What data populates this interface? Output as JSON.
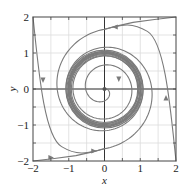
{
  "chart_data": {
    "type": "line",
    "title": "",
    "subtitle": "Phase portrait with stable limit cycle (spiral out from origin, spiral in from outside)",
    "xlabel": "x",
    "ylabel": "y",
    "xlim": [
      -2,
      2
    ],
    "ylim": [
      -2,
      2
    ],
    "xticks": [
      -2,
      -1,
      0,
      1,
      2
    ],
    "yticks": [
      -2,
      -1,
      0,
      1,
      2
    ],
    "xtick_labels": [
      "−2",
      "−1",
      "0",
      "1",
      "2"
    ],
    "ytick_labels": [
      "−2",
      "−1",
      "0",
      "1",
      "2"
    ],
    "grid": true,
    "grid_spacing": 0.5,
    "legend": null,
    "series": [
      {
        "name": "limit-cycle",
        "description": "Closed orbit approximately a circle of radius 1 centered at origin",
        "radius": 1.0
      },
      {
        "name": "inner-spiral",
        "description": "Trajectory starting near origin spiraling outward toward the limit cycle",
        "start": [
          0.05,
          0.0
        ],
        "approach_radius": 1.0
      },
      {
        "name": "outer-trajectory-top",
        "description": "Trajectory entering from (2,2), passing near (0,1.65), spiraling inward to the limit cycle",
        "start": [
          2,
          2
        ],
        "points": [
          [
            2,
            2
          ],
          [
            1,
            1.9
          ],
          [
            0.3,
            1.75
          ],
          [
            0,
            1.65
          ],
          [
            -0.6,
            1.4
          ],
          [
            -1.1,
            0.8
          ],
          [
            -1.25,
            0
          ],
          [
            -1.1,
            -0.7
          ],
          [
            -0.5,
            -1.15
          ],
          [
            0.3,
            -1.15
          ],
          [
            1,
            -0.6
          ],
          [
            1.15,
            0.1
          ]
        ]
      },
      {
        "name": "outer-trajectory-bottom",
        "description": "Trajectory entering from (-2,-2), passing near (0,-1.65), spiraling inward to the limit cycle",
        "start": [
          -2,
          -2
        ],
        "points": [
          [
            -2,
            -2
          ],
          [
            -1,
            -1.9
          ],
          [
            -0.3,
            -1.75
          ],
          [
            0,
            -1.65
          ],
          [
            0.6,
            -1.4
          ],
          [
            1.1,
            -0.8
          ],
          [
            1.25,
            0
          ],
          [
            1.1,
            0.7
          ],
          [
            0.5,
            1.15
          ],
          [
            -0.3,
            1.15
          ],
          [
            -1,
            0.6
          ],
          [
            -1.15,
            -0.1
          ]
        ]
      },
      {
        "name": "left-edge-trajectory",
        "description": "Trajectory from (-2,2) descending steeply toward (-2,-2) curving along bottom",
        "points": [
          [
            -2,
            2
          ],
          [
            -1.85,
            1
          ],
          [
            -1.72,
            0.3
          ],
          [
            -1.6,
            -0.5
          ],
          [
            -1.4,
            -1.1
          ],
          [
            -1,
            -1.5
          ]
        ]
      },
      {
        "name": "right-edge-trajectory",
        "description": "Trajectory from (2,-2) rising steeply toward (2,2) curving along top",
        "points": [
          [
            2,
            -2
          ],
          [
            1.85,
            -1
          ],
          [
            1.72,
            -0.3
          ],
          [
            1.6,
            0.5
          ],
          [
            1.4,
            1.1
          ],
          [
            1,
            1.5
          ]
        ]
      }
    ],
    "arrows": [
      {
        "at": [
          0.3,
          1.72
        ],
        "direction": "left"
      },
      {
        "at": [
          -1.72,
          0.25
        ],
        "direction": "down"
      },
      {
        "at": [
          1.72,
          -0.25
        ],
        "direction": "up"
      },
      {
        "at": [
          -0.3,
          -1.72
        ],
        "direction": "right"
      },
      {
        "at": [
          0.4,
          0.28
        ],
        "direction": "down"
      },
      {
        "at": [
          -1.5,
          -1.9
        ],
        "direction": "right"
      }
    ],
    "colors": {
      "curve": "#7a7a7a",
      "axis": "#333333",
      "grid": "#dcdcdc",
      "frame": "#444444"
    }
  }
}
